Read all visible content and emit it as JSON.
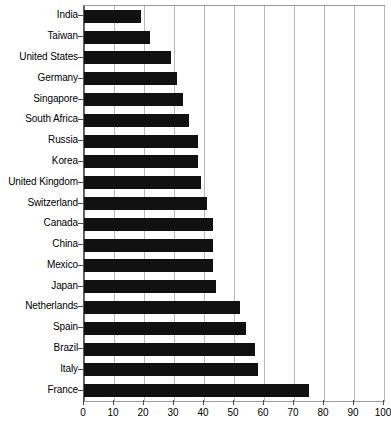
{
  "chart_data": {
    "type": "bar",
    "orientation": "horizontal",
    "title": "",
    "subtitle": "",
    "xlabel": "",
    "ylabel": "",
    "xlim": [
      0,
      100
    ],
    "grid": "vertical",
    "legend": "none",
    "xticks": [
      0,
      10,
      20,
      30,
      40,
      50,
      60,
      70,
      80,
      90,
      100
    ],
    "xtick_labels": [
      "0",
      "10",
      "20",
      "30",
      "40",
      "50",
      "60",
      "70",
      "80",
      "90",
      "100"
    ],
    "categories": [
      "India",
      "Taiwan",
      "United States",
      "Germany",
      "Singapore",
      "South Africa",
      "Russia",
      "Korea",
      "United Kingdom",
      "Switzerland",
      "Canada",
      "China",
      "Mexico",
      "Japan",
      "Netherlands",
      "Spain",
      "Brazil",
      "Italy",
      "France"
    ],
    "values": [
      19,
      22,
      29,
      31,
      33,
      35,
      38,
      38,
      39,
      41,
      43,
      43,
      43,
      44,
      52,
      54,
      57,
      58,
      75
    ],
    "bar_color": "#111111",
    "grid_color": "#b9b9b9",
    "axis_color": "#4a4a4a",
    "background_color": "#ffffff"
  }
}
